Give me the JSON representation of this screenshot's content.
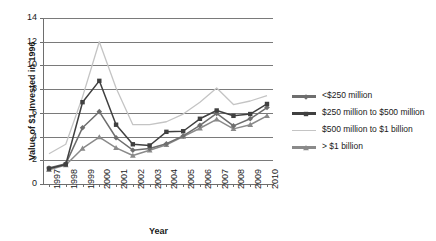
{
  "chart_data": {
    "type": "line",
    "title": "",
    "xlabel": "Year",
    "ylabel": "Value of $1 Invested in 1996",
    "ylim": [
      0,
      14
    ],
    "ytick_step": 2,
    "yticks": [
      "0",
      "2",
      "4",
      "6",
      "8",
      "10",
      "12",
      "14"
    ],
    "grid": "horizontal",
    "legend_position": "right",
    "categories": [
      "1997",
      "1998",
      "1999",
      "2000",
      "2001",
      "2002",
      "2003",
      "2004",
      "2005",
      "2006",
      "2007",
      "2008",
      "2009",
      "2010"
    ],
    "series": [
      {
        "name": "<$250 million",
        "marker": "diamond",
        "color": "#6e6e6e",
        "values": [
          1.35,
          1.7,
          4.75,
          6.1,
          3.9,
          2.85,
          3.0,
          3.4,
          4.05,
          4.95,
          5.95,
          4.9,
          5.5,
          6.45
        ]
      },
      {
        "name": "$250 million to $500 million",
        "marker": "square",
        "color": "#404040",
        "values": [
          1.3,
          1.65,
          6.9,
          8.7,
          5.0,
          3.35,
          3.25,
          4.4,
          4.45,
          5.5,
          6.2,
          5.75,
          5.9,
          6.75
        ]
      },
      {
        "name": "$500 million to $1 billion",
        "marker": "none",
        "color": "#c4c4c4",
        "values": [
          2.55,
          3.35,
          7.35,
          12.0,
          8.1,
          5.0,
          5.0,
          5.25,
          5.9,
          6.9,
          8.1,
          6.7,
          7.0,
          7.45
        ]
      },
      {
        "name": "> $1 billion",
        "marker": "triangle",
        "color": "#8a8a8a",
        "values": [
          1.2,
          1.6,
          3.0,
          3.95,
          3.05,
          2.4,
          2.85,
          3.3,
          4.0,
          4.7,
          5.45,
          4.65,
          5.0,
          5.75
        ]
      }
    ]
  },
  "axes": {
    "y_title": "Value of $1 Invested in 1996",
    "x_title": "Year"
  },
  "legend": {
    "items": [
      {
        "label": "<$250 million"
      },
      {
        "label": "$250 million to $500 million"
      },
      {
        "label": "$500 million to $1 billion"
      },
      {
        "label": "> $1 billion"
      }
    ]
  }
}
